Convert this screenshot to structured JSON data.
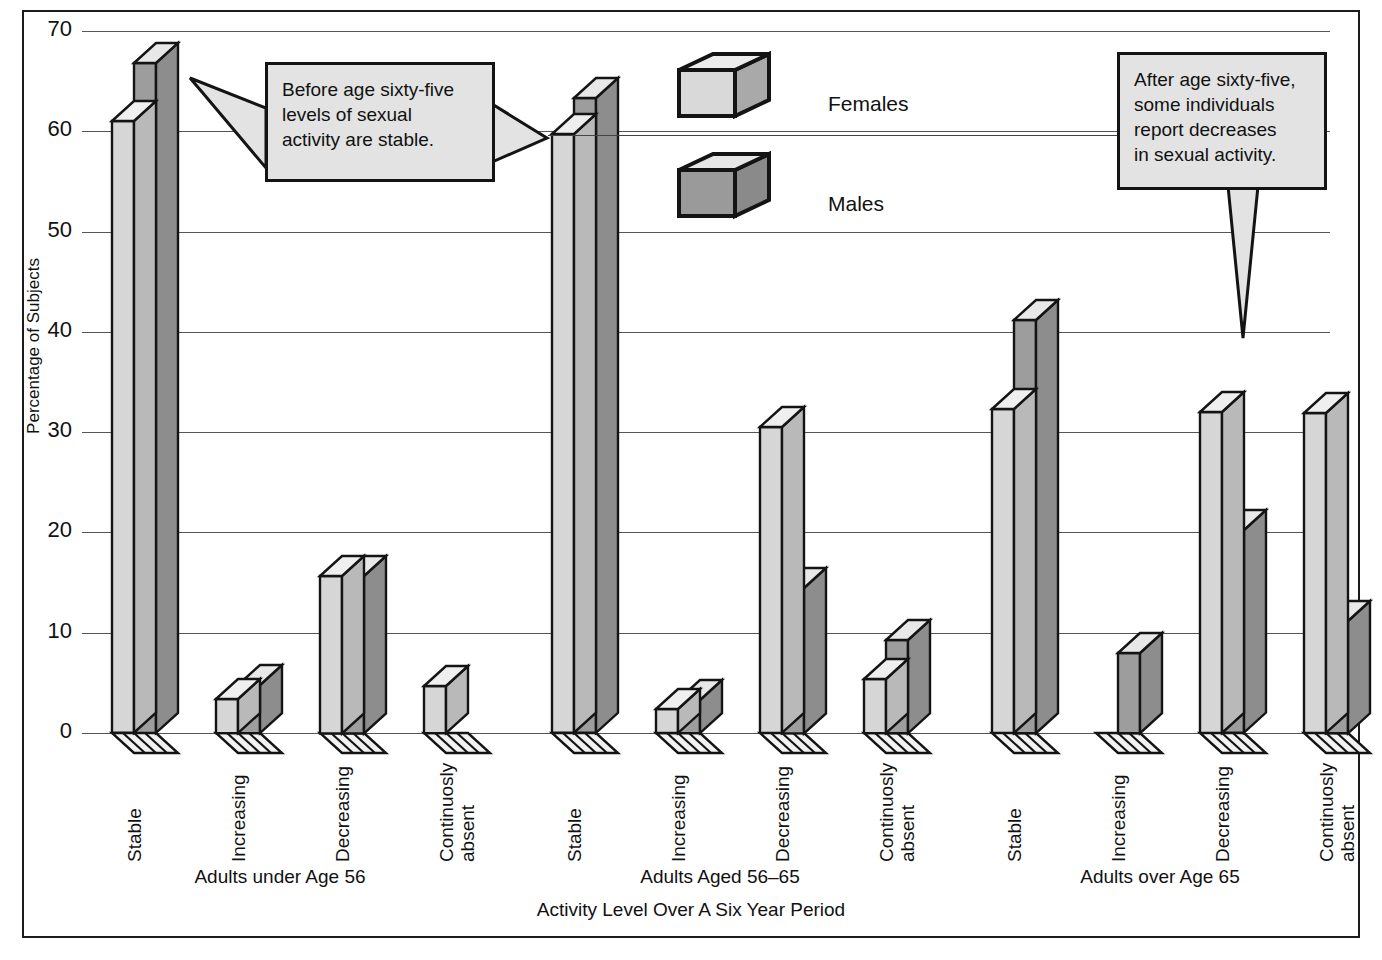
{
  "chart_data": {
    "type": "bar",
    "title": "",
    "xlabel": "Activity Level Over A Six Year Period",
    "ylabel": "Percentage of Subjects",
    "ylim": [
      0,
      70
    ],
    "yticks": [
      0,
      10,
      20,
      30,
      40,
      50,
      60,
      70
    ],
    "ytick_labels": [
      "0",
      "10",
      "20",
      "30",
      "40",
      "50",
      "60",
      "70"
    ],
    "grid": true,
    "legend_position": "top-center",
    "categories": [
      "Stable",
      "Increasing",
      "Decreasing",
      "Continuosly\nabsent"
    ],
    "groups": [
      {
        "name": "Adults under Age 56",
        "series": [
          {
            "name": "Females",
            "values": [
              61.0,
              3.4,
              15.7,
              4.7
            ]
          },
          {
            "name": "Males",
            "values": [
              66.8,
              4.8,
              15.7,
              0
            ]
          }
        ]
      },
      {
        "name": "Adults Aged 56–65",
        "series": [
          {
            "name": "Females",
            "values": [
              59.7,
              2.4,
              30.5,
              5.4
            ]
          },
          {
            "name": "Males",
            "values": [
              63.3,
              3.3,
              14.5,
              9.3
            ]
          }
        ]
      },
      {
        "name": "Adults over Age 65",
        "series": [
          {
            "name": "Females",
            "values": [
              32.3,
              0,
              32.0,
              31.9
            ]
          },
          {
            "name": "Males",
            "values": [
              41.2,
              8.0,
              20.2,
              11.2
            ]
          }
        ]
      }
    ],
    "series_colors": {
      "Females": "#d4d4d4",
      "Males": "#9a9a9a"
    },
    "annotations": [
      "Before age sixty-five\nlevels of sexual\nactivity are stable.",
      "After age sixty-five,\nsome individuals\nreport decreases\nin sexual activity."
    ]
  },
  "legend": {
    "items": [
      {
        "label": "Females",
        "color": "#d4d4d4"
      },
      {
        "label": "Males",
        "color": "#9a9a9a"
      }
    ]
  },
  "axes": {
    "y_title": "Percentage of Subjects",
    "x_title": "Activity Level Over A Six Year Period",
    "y_ticks": [
      "70",
      "60",
      "50",
      "40",
      "30",
      "20",
      "10",
      "0"
    ]
  },
  "group_labels": [
    "Adults under Age 56",
    "Adults Aged 56–65",
    "Adults over Age 65"
  ],
  "category_labels": [
    "Stable",
    "Increasing",
    "Decreasing",
    "Continuosly\nabsent"
  ],
  "callouts": {
    "left": "Before age sixty-five\nlevels of sexual\nactivity are stable.",
    "right": "After age sixty-five,\nsome individuals\nreport decreases\nin sexual activity."
  }
}
